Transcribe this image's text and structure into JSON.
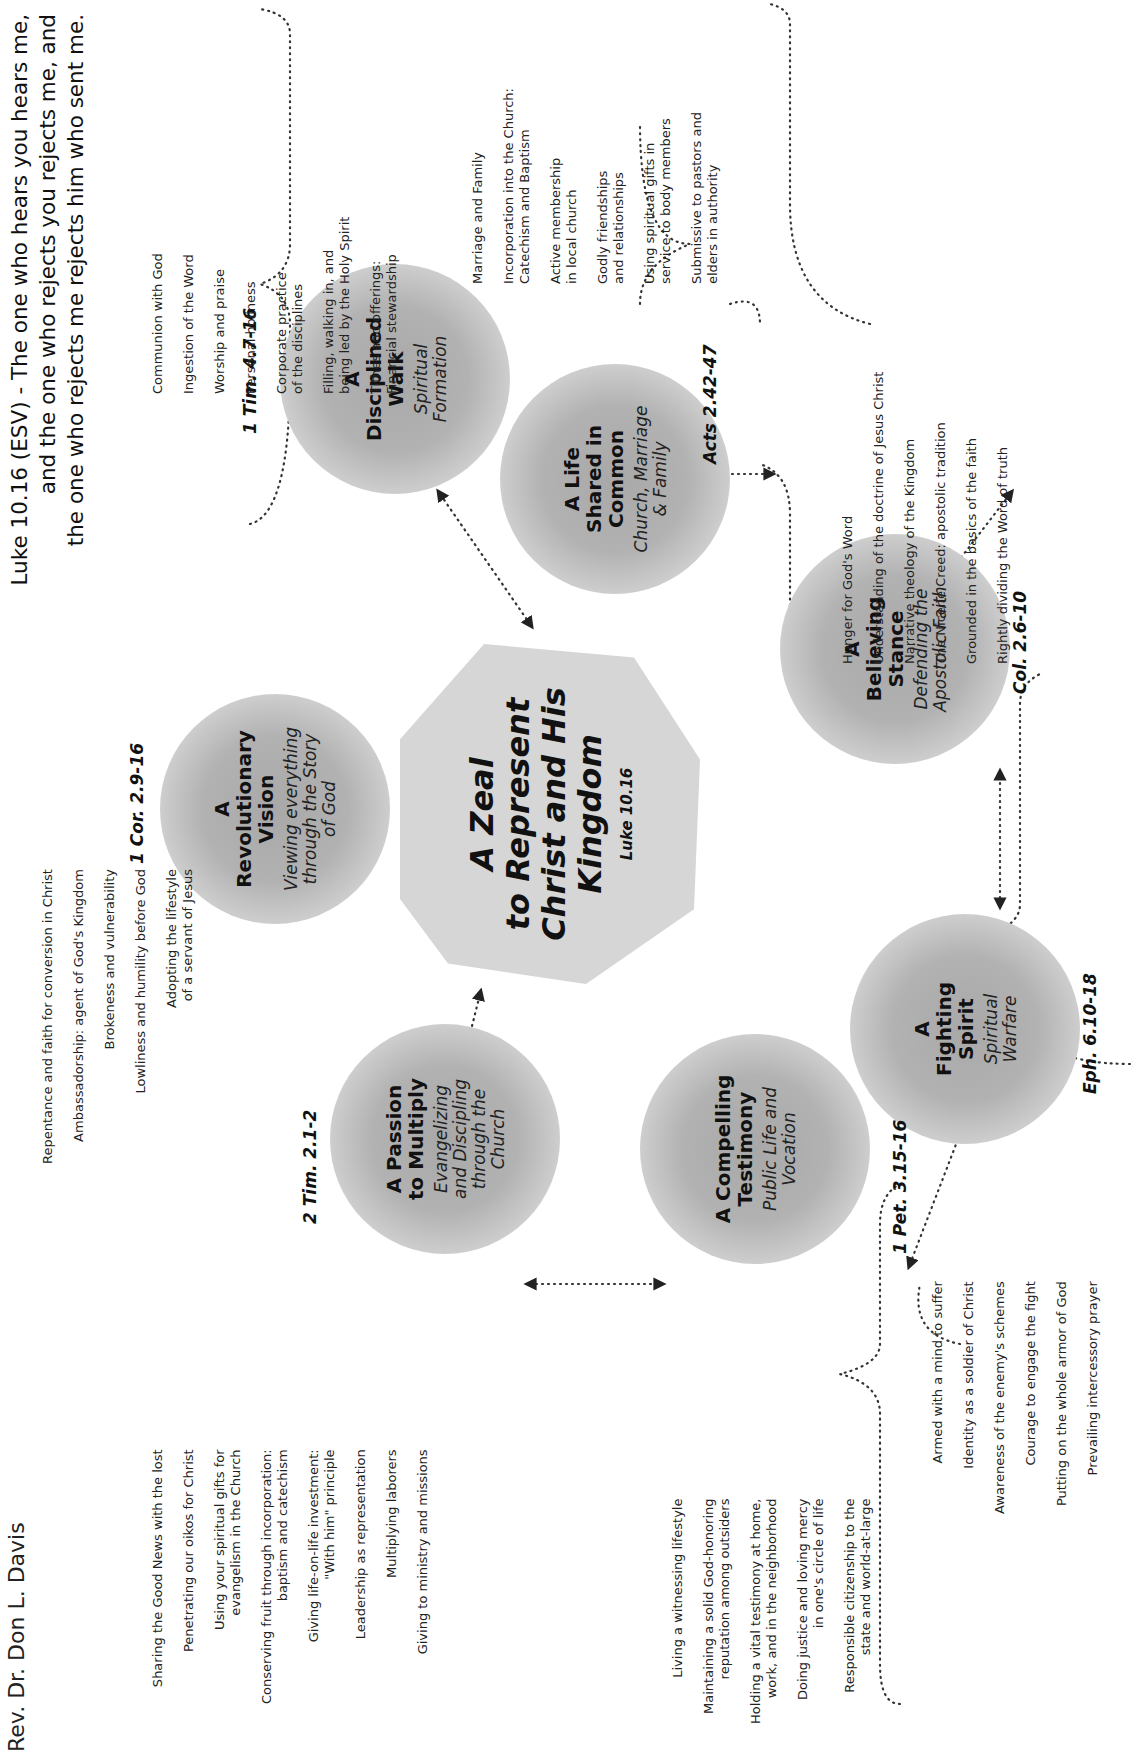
{
  "orientation": "rotated-90-ccw",
  "header": {
    "author": "Rev. Dr. Don L. Davis",
    "verse_lines": [
      "Luke 10.16 (ESV) - The one who hears you hears me,",
      "and the one who rejects you rejects me, and",
      "the one who rejects me rejects him who sent me."
    ]
  },
  "hub": {
    "title": "A Zeal\nto Represent\nChrist and His\nKingdom",
    "reference": "Luke 10.16"
  },
  "nodes": [
    {
      "title": "A\nRevolutionary\nVision",
      "subtitle": "Viewing everything\nthrough the Story\nof God",
      "reference": "1 Cor. 2.9-16",
      "items": [
        "Repentance and faith for conversion in Christ",
        "Ambassadorship: agent of God's Kingdom",
        "Brokeness and vulnerability",
        "Lowliness and humility before God",
        "Adopting the lifestyle\nof a servant of Jesus"
      ]
    },
    {
      "title": "A\nDisciplined\nWalk",
      "subtitle": "Spiritual\nFormation",
      "reference": "1 Tim. 4.7-16",
      "items": [
        "Communion with God",
        "Ingestion of the Word",
        "Worship and praise",
        "Personal holiness",
        "Corporate practice\nof the disciplines",
        "Filling, walking in, and\nbeing led by the Holy Spirit",
        "Tithes and offerings:\nFinancial stewardship"
      ]
    },
    {
      "title": "A Life\nShared in\nCommon",
      "subtitle": "Church, Marriage\n& Family",
      "reference": "Acts 2.42-47",
      "items": [
        "Marriage and Family",
        "Incorporation into the Church:\nCatechism and Baptism",
        "Active membership\nin local church",
        "Godly friendships\nand relationships",
        "Using spiritual gifts in\nservice to body members",
        "Submissive to pastors and\nelders in authority"
      ]
    },
    {
      "title": "A\nBelieving\nStance",
      "subtitle": "Defending the\nApostolic Faith",
      "reference": "Col. 2.6-10",
      "items": [
        "Hunger for God's Word",
        "Understanding of the doctrine of Jesus Christ",
        "Narrative theology of the Kingdom",
        "The Nicene Creed: apostolic tradition",
        "Grounded in the basics of the faith",
        "Rightly dividing the Word of truth"
      ]
    },
    {
      "title": "A\nFighting\nSpirit",
      "subtitle": "Spiritual\nWarfare",
      "reference": "Eph. 6.10-18",
      "items": [
        "Armed with a mind to suffer",
        "Identity as a soldier of Christ",
        "Awareness of the enemy's schemes",
        "Courage to engage the fight",
        "Putting on the whole armor of God",
        "Prevailing intercessory prayer"
      ]
    },
    {
      "title": "A Compelling\nTestimony",
      "subtitle": "Public Life and\nVocation",
      "reference": "1 Pet. 3.15-16",
      "items": [
        "Living a witnessing lifestyle",
        "Maintaining a solid God-honoring\nreputation among outsiders",
        "Holding a vital testimony at home,\nwork, and in the neighborhood",
        "Doing justice and loving mercy\nin one's circle of life",
        "Responsible citizenship to the\nstate and world-at-large"
      ]
    },
    {
      "title": "A Passion\nto Multiply",
      "subtitle": "Evangelizing\nand Discipling\nthrough the\nChurch",
      "reference": "2 Tim. 2.1-2",
      "items": [
        "Sharing the Good News with the lost",
        "Penetrating our oikos for Christ",
        "Using your spiritual gifts for\nevangelism in the Church",
        "Conserving fruit through incorporation:\nbaptism and catechism",
        "Giving life-on-life investment:\n\"With him\" principle",
        "Leadership as representation",
        "Multiplying laborers",
        "Giving to ministry and missions"
      ]
    }
  ],
  "colors": {
    "node_fill": "#b0b0b0",
    "hub_fill": "#d6d6d6",
    "text": "#1a1a1a",
    "connector": "#222222"
  }
}
